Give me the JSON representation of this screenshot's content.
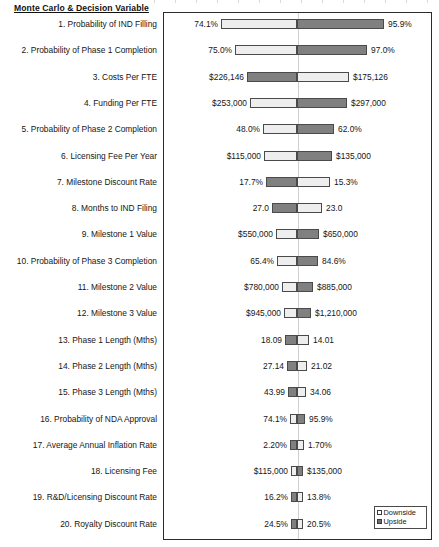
{
  "header": {
    "title": "Monte Carlo & Decision Variable"
  },
  "legend": {
    "items": [
      {
        "label": "Downside",
        "swatch": "light-square-swatch",
        "color": "#ffffff"
      },
      {
        "label": "Upside",
        "swatch": "dark-square-swatch",
        "color": "#6f6f6f"
      }
    ]
  },
  "colors": {
    "downside": "#eeeeee",
    "upside": "#808080",
    "bar_border": "#4a4a4a",
    "frame": "#2b2b2b",
    "center_line": "#cfcfcf"
  },
  "chart_data": {
    "type": "bar",
    "chart_kind": "tornado",
    "title": "Monte Carlo & Decision Variable",
    "xlabel": "",
    "ylabel": "",
    "grid": false,
    "legend_position": "bottom-right",
    "center_reference": "base case",
    "series": [
      {
        "name": "Downside",
        "color": "#eeeeee"
      },
      {
        "name": "Upside",
        "color": "#808080"
      }
    ],
    "categories": [
      "1. Probability of IND Filling",
      "2. Probability of Phase 1 Completion",
      "3. Costs Per FTE",
      "4. Funding Per FTE",
      "5. Probability of Phase 2 Completion",
      "6. Licensing Fee Per Year",
      "7. Milestone Discount Rate",
      "8. Months to IND Filing",
      "9. Milestone 1 Value",
      "10. Probability of Phase 3 Completion",
      "11. Milestone 2 Value",
      "12. Milestone 3 Value",
      "13. Phase 1 Length (Mths)",
      "14. Phase 2 Length (Mths)",
      "15. Phase 3 Length (Mths)",
      "16. Probability of NDA Approval",
      "17. Average Annual Inflation Rate",
      "18. Licensing Fee",
      "19. R&D/Licensing Discount Rate",
      "20. Royalty Discount Rate"
    ],
    "rows": [
      {
        "rank": 1,
        "label": "1. Probability of IND Filling",
        "left_value": "74.1%",
        "right_value": "95.9%",
        "left_span": 76,
        "right_span": 87,
        "left_fill": "downside",
        "right_fill": "upside"
      },
      {
        "rank": 2,
        "label": "2. Probability of Phase 1 Completion",
        "left_value": "75.0%",
        "right_value": "97.0%",
        "left_span": 62,
        "right_span": 70,
        "left_fill": "downside",
        "right_fill": "upside"
      },
      {
        "rank": 3,
        "label": "3. Costs Per FTE",
        "left_value": "$226,146",
        "right_value": "$175,126",
        "left_span": 50,
        "right_span": 52,
        "left_fill": "upside",
        "right_fill": "downside"
      },
      {
        "rank": 4,
        "label": "4. Funding Per FTE",
        "left_value": "$253,000",
        "right_value": "$297,000",
        "left_span": 47,
        "right_span": 50,
        "left_fill": "downside",
        "right_fill": "upside"
      },
      {
        "rank": 5,
        "label": "5. Probability of Phase 2 Completion",
        "left_value": "48.0%",
        "right_value": "62.0%",
        "left_span": 34,
        "right_span": 37,
        "left_fill": "downside",
        "right_fill": "upside"
      },
      {
        "rank": 6,
        "label": "6. Licensing Fee Per Year",
        "left_value": "$115,000",
        "right_value": "$135,000",
        "left_span": 33,
        "right_span": 35,
        "left_fill": "downside",
        "right_fill": "upside"
      },
      {
        "rank": 7,
        "label": "7. Milestone Discount Rate",
        "left_value": "17.7%",
        "right_value": "15.3%",
        "left_span": 31,
        "right_span": 33,
        "left_fill": "upside",
        "right_fill": "downside"
      },
      {
        "rank": 8,
        "label": "8. Months to IND Filing",
        "left_value": "27.0",
        "right_value": "23.0",
        "left_span": 25,
        "right_span": 25,
        "left_fill": "upside",
        "right_fill": "downside"
      },
      {
        "rank": 9,
        "label": "9. Milestone 1 Value",
        "left_value": "$550,000",
        "right_value": "$650,000",
        "left_span": 21,
        "right_span": 22,
        "left_fill": "downside",
        "right_fill": "upside"
      },
      {
        "rank": 10,
        "label": "10. Probability of Phase 3 Completion",
        "left_value": "65.4%",
        "right_value": "84.6%",
        "left_span": 20,
        "right_span": 21,
        "left_fill": "downside",
        "right_fill": "upside"
      },
      {
        "rank": 11,
        "label": "11. Milestone 2 Value",
        "left_value": "$780,000",
        "right_value": "$885,000",
        "left_span": 15,
        "right_span": 16,
        "left_fill": "downside",
        "right_fill": "upside"
      },
      {
        "rank": 12,
        "label": "12. Milestone 3 Value",
        "left_value": "$945,000",
        "right_value": "$1,210,000",
        "left_span": 13,
        "right_span": 14,
        "left_fill": "downside",
        "right_fill": "upside"
      },
      {
        "rank": 13,
        "label": "13. Phase 1 Length (Mths)",
        "left_value": "18.09",
        "right_value": "14.01",
        "left_span": 12,
        "right_span": 12,
        "left_fill": "upside",
        "right_fill": "downside"
      },
      {
        "rank": 14,
        "label": "14. Phase 2 Length (Mths)",
        "left_value": "27.14",
        "right_value": "21.02",
        "left_span": 10,
        "right_span": 10,
        "left_fill": "upside",
        "right_fill": "downside"
      },
      {
        "rank": 15,
        "label": "15. Phase 3 Length (Mths)",
        "left_value": "43.99",
        "right_value": "34.06",
        "left_span": 9,
        "right_span": 9,
        "left_fill": "upside",
        "right_fill": "downside"
      },
      {
        "rank": 16,
        "label": "16. Probability of NDA Approval",
        "left_value": "74.1%",
        "right_value": "95.9%",
        "left_span": 7,
        "right_span": 8,
        "left_fill": "downside",
        "right_fill": "upside"
      },
      {
        "rank": 17,
        "label": "17. Average Annual Inflation Rate",
        "left_value": "2.20%",
        "right_value": "1.70%",
        "left_span": 7,
        "right_span": 7,
        "left_fill": "upside",
        "right_fill": "downside"
      },
      {
        "rank": 18,
        "label": "18. Licensing Fee",
        "left_value": "$115,000",
        "right_value": "$135,000",
        "left_span": 6,
        "right_span": 6,
        "left_fill": "downside",
        "right_fill": "upside"
      },
      {
        "rank": 19,
        "label": "19. R&D/Licensing Discount Rate",
        "left_value": "16.2%",
        "right_value": "13.8%",
        "left_span": 6,
        "right_span": 6,
        "left_fill": "upside",
        "right_fill": "downside"
      },
      {
        "rank": 20,
        "label": "20. Royalty Discount Rate",
        "left_value": "24.5%",
        "right_value": "20.5%",
        "left_span": 6,
        "right_span": 6,
        "left_fill": "upside",
        "right_fill": "downside"
      }
    ]
  }
}
